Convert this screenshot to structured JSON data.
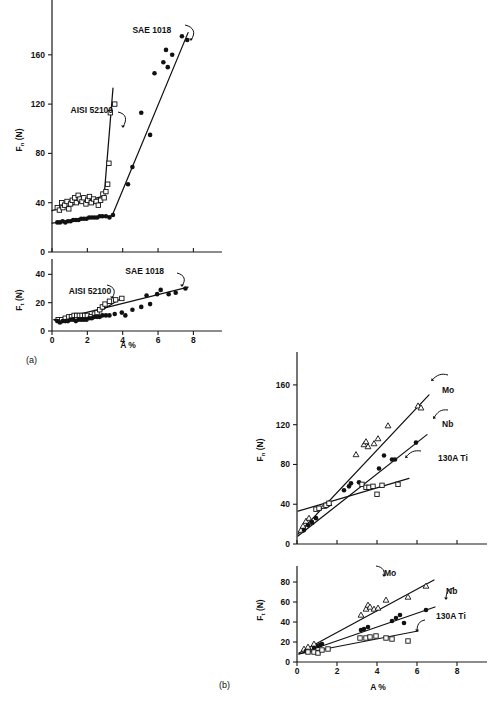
{
  "figure": {
    "panel_a_label": "(a)",
    "panel_b_label": "(b)",
    "xlabel": "A %"
  },
  "chart_data": [
    {
      "id": "a-upper",
      "type": "scatter",
      "title": "",
      "xlabel": "",
      "ylabel": "F_n (N)",
      "ylabel_main": "F",
      "ylabel_sub": "n",
      "ylabel_unit": " (N)",
      "xlim": [
        0,
        8.6
      ],
      "ylim": [
        0,
        185
      ],
      "xticks": [
        0,
        2,
        4,
        6,
        8
      ],
      "xticklabels": [
        "0",
        "2",
        "4",
        "6",
        "8"
      ],
      "yticks": [
        0,
        40,
        80,
        120,
        160
      ],
      "yticklabels": [
        "0",
        "40",
        "80",
        "120",
        "160"
      ],
      "grid": false,
      "legend": "annotations",
      "annotations": [
        {
          "text": "SAE 1018",
          "x": 4.55,
          "y": 178
        },
        {
          "text": "AISI 52100",
          "x": 1.05,
          "y": 113
        }
      ],
      "series": [
        {
          "name": "AISI 52100",
          "marker": "open-square",
          "points": [
            [
              0.3,
              36
            ],
            [
              0.42,
              34
            ],
            [
              0.55,
              40
            ],
            [
              0.62,
              36
            ],
            [
              0.72,
              38
            ],
            [
              0.85,
              41
            ],
            [
              0.95,
              35
            ],
            [
              1.05,
              39
            ],
            [
              1.15,
              42
            ],
            [
              1.28,
              44
            ],
            [
              1.38,
              40
            ],
            [
              1.48,
              46
            ],
            [
              1.58,
              43
            ],
            [
              1.7,
              41
            ],
            [
              1.8,
              44
            ],
            [
              1.92,
              39
            ],
            [
              2.02,
              42
            ],
            [
              2.12,
              45
            ],
            [
              2.22,
              40
            ],
            [
              2.35,
              43
            ],
            [
              2.5,
              41
            ],
            [
              2.62,
              38
            ],
            [
              2.75,
              42
            ],
            [
              2.88,
              47
            ],
            [
              2.95,
              44
            ],
            [
              3.05,
              49
            ],
            [
              3.15,
              55
            ],
            [
              3.22,
              72
            ],
            [
              3.3,
              113
            ],
            [
              3.55,
              120
            ]
          ],
          "trend": [
            [
              0.0,
              33.5
            ],
            [
              2.95,
              45.5
            ],
            [
              3.45,
              133
            ]
          ]
        },
        {
          "name": "SAE 1018",
          "marker": "filled-circle",
          "points": [
            [
              0.3,
              24
            ],
            [
              0.45,
              24
            ],
            [
              0.6,
              25
            ],
            [
              0.75,
              24
            ],
            [
              0.9,
              25
            ],
            [
              1.05,
              25
            ],
            [
              1.2,
              26
            ],
            [
              1.35,
              26
            ],
            [
              1.5,
              26
            ],
            [
              1.65,
              27
            ],
            [
              1.8,
              27
            ],
            [
              1.95,
              27
            ],
            [
              2.1,
              28
            ],
            [
              2.25,
              28
            ],
            [
              2.4,
              28
            ],
            [
              2.55,
              28
            ],
            [
              2.7,
              29
            ],
            [
              2.85,
              29
            ],
            [
              3.05,
              29
            ],
            [
              3.25,
              28
            ],
            [
              3.45,
              30
            ],
            [
              4.3,
              55
            ],
            [
              4.55,
              69
            ],
            [
              5.05,
              113
            ],
            [
              5.55,
              95
            ],
            [
              5.8,
              145
            ],
            [
              6.3,
              154
            ],
            [
              6.45,
              164
            ],
            [
              6.55,
              150
            ],
            [
              6.8,
              160
            ],
            [
              7.35,
              175
            ],
            [
              7.65,
              172
            ]
          ],
          "trend": [
            [
              0.0,
              23.5
            ],
            [
              3.4,
              29.5
            ],
            [
              7.7,
              178
            ]
          ]
        }
      ]
    },
    {
      "id": "a-lower",
      "type": "scatter",
      "title": "",
      "xlabel": "A %",
      "ylabel": "F_t (N)",
      "ylabel_main": "F",
      "ylabel_sub": "t",
      "ylabel_unit": " (N)",
      "xlim": [
        0,
        8.6
      ],
      "ylim": [
        0,
        48
      ],
      "xticks": [
        0,
        2,
        4,
        6,
        8
      ],
      "xticklabels": [
        "0",
        "2",
        "4",
        "6",
        "8"
      ],
      "yticks": [
        0,
        20,
        40
      ],
      "yticklabels": [
        "0",
        "20",
        "40"
      ],
      "grid": false,
      "legend": "annotations",
      "annotations": [
        {
          "text": "SAE 1018",
          "x": 4.15,
          "y": 40
        },
        {
          "text": "AISI 52100",
          "x": 0.95,
          "y": 26
        }
      ],
      "series": [
        {
          "name": "AISI 52100",
          "marker": "open-square",
          "points": [
            [
              0.35,
              8
            ],
            [
              0.55,
              8
            ],
            [
              0.75,
              9
            ],
            [
              0.95,
              10
            ],
            [
              1.1,
              10
            ],
            [
              1.25,
              11
            ],
            [
              1.4,
              11
            ],
            [
              1.55,
              11
            ],
            [
              1.7,
              11
            ],
            [
              1.85,
              11
            ],
            [
              2.0,
              11
            ],
            [
              2.2,
              10
            ],
            [
              2.4,
              12
            ],
            [
              2.55,
              13
            ],
            [
              2.7,
              15
            ],
            [
              2.85,
              17
            ],
            [
              3.0,
              19
            ],
            [
              3.25,
              21
            ],
            [
              3.6,
              22
            ],
            [
              3.95,
              23
            ]
          ],
          "trend": [
            [
              0.1,
              8
            ],
            [
              2.4,
              11.5
            ],
            [
              4.05,
              24
            ]
          ]
        },
        {
          "name": "SAE 1018",
          "marker": "filled-circle",
          "points": [
            [
              0.3,
              7
            ],
            [
              0.45,
              6
            ],
            [
              0.6,
              7
            ],
            [
              0.75,
              7
            ],
            [
              0.9,
              7
            ],
            [
              1.05,
              8
            ],
            [
              1.2,
              8
            ],
            [
              1.35,
              7
            ],
            [
              1.5,
              8
            ],
            [
              1.65,
              8
            ],
            [
              1.8,
              8
            ],
            [
              1.95,
              8
            ],
            [
              2.1,
              9
            ],
            [
              2.25,
              9
            ],
            [
              2.4,
              10
            ],
            [
              2.55,
              10
            ],
            [
              2.7,
              10
            ],
            [
              2.85,
              11
            ],
            [
              3.05,
              11
            ],
            [
              3.25,
              11
            ],
            [
              3.55,
              12
            ],
            [
              3.95,
              13
            ],
            [
              4.15,
              11
            ],
            [
              4.55,
              15
            ],
            [
              5.05,
              17
            ],
            [
              5.35,
              25
            ],
            [
              5.55,
              19
            ],
            [
              5.95,
              26
            ],
            [
              6.15,
              29
            ],
            [
              6.6,
              26
            ],
            [
              7.0,
              27
            ],
            [
              7.55,
              30
            ]
          ],
          "trend": [
            [
              0.15,
              7.5
            ],
            [
              7.7,
              31
            ]
          ]
        }
      ]
    },
    {
      "id": "b-upper",
      "type": "scatter",
      "title": "",
      "xlabel": "",
      "ylabel": "F_n (N)",
      "ylabel_main": "F",
      "ylabel_sub": "n",
      "ylabel_unit": " (N)",
      "xlim": [
        0,
        8.6
      ],
      "ylim": [
        0,
        175
      ],
      "xticks": [
        0,
        2,
        4,
        6,
        8
      ],
      "xticklabels": [
        "0",
        "2",
        "4",
        "6",
        "8"
      ],
      "yticks": [
        0,
        40,
        80,
        120,
        160
      ],
      "yticklabels": [
        "0",
        "40",
        "80",
        "120",
        "160"
      ],
      "grid": false,
      "legend": "annotations",
      "annotations": [
        {
          "text": "Mo",
          "x": 7.25,
          "y": 152
        },
        {
          "text": "Nb",
          "x": 7.25,
          "y": 118
        },
        {
          "text": "130A Ti",
          "x": 7.05,
          "y": 83
        }
      ],
      "series": [
        {
          "name": "Mo",
          "marker": "open-triangle",
          "points": [
            [
              0.2,
              14
            ],
            [
              0.3,
              18
            ],
            [
              0.45,
              23
            ],
            [
              0.6,
              26
            ],
            [
              0.7,
              22
            ],
            [
              1.35,
              38
            ],
            [
              1.5,
              40
            ],
            [
              1.6,
              41
            ],
            [
              2.95,
              90
            ],
            [
              3.35,
              100
            ],
            [
              3.45,
              103
            ],
            [
              3.55,
              98
            ],
            [
              3.85,
              101
            ],
            [
              4.05,
              106
            ],
            [
              4.55,
              119
            ],
            [
              6.05,
              139
            ],
            [
              6.2,
              137
            ]
          ],
          "trend": [
            [
              0.05,
              10
            ],
            [
              6.6,
              150
            ]
          ]
        },
        {
          "name": "Nb",
          "marker": "filled-circle",
          "points": [
            [
              0.35,
              14
            ],
            [
              0.55,
              19
            ],
            [
              0.75,
              22
            ],
            [
              0.95,
              26
            ],
            [
              2.35,
              54
            ],
            [
              2.6,
              58
            ],
            [
              2.7,
              61
            ],
            [
              3.1,
              62
            ],
            [
              4.1,
              76
            ],
            [
              4.35,
              89
            ],
            [
              4.75,
              85
            ],
            [
              4.9,
              85
            ],
            [
              5.95,
              102
            ]
          ],
          "trend": [
            [
              0.05,
              8
            ],
            [
              6.5,
              110
            ]
          ]
        },
        {
          "name": "130A Ti",
          "marker": "open-square",
          "points": [
            [
              0.95,
              35
            ],
            [
              1.1,
              36
            ],
            [
              1.45,
              39
            ],
            [
              1.6,
              41
            ],
            [
              3.25,
              60
            ],
            [
              3.45,
              57
            ],
            [
              3.6,
              57
            ],
            [
              3.8,
              58
            ],
            [
              4.0,
              50
            ],
            [
              4.25,
              59
            ],
            [
              5.05,
              60
            ]
          ],
          "trend": [
            [
              0.05,
              33
            ],
            [
              5.6,
              66
            ]
          ]
        }
      ]
    },
    {
      "id": "b-lower",
      "type": "scatter",
      "title": "",
      "xlabel": "A %",
      "ylabel": "F_t (N)",
      "ylabel_main": "F",
      "ylabel_sub": "t",
      "ylabel_unit": " (N)",
      "xlim": [
        0,
        8.6
      ],
      "ylim": [
        0,
        92
      ],
      "xticks": [
        0,
        2,
        4,
        6,
        8
      ],
      "xticklabels": [
        "0",
        "2",
        "4",
        "6",
        "8"
      ],
      "yticks": [
        0,
        20,
        40,
        60,
        80
      ],
      "yticklabels": [
        "0",
        "20",
        "40",
        "60",
        "80"
      ],
      "grid": false,
      "legend": "annotations",
      "annotations": [
        {
          "text": "Mo",
          "x": 4.35,
          "y": 86
        },
        {
          "text": "Nb",
          "x": 7.45,
          "y": 68
        },
        {
          "text": "130A Ti",
          "x": 6.95,
          "y": 43
        }
      ],
      "series": [
        {
          "name": "Mo",
          "marker": "open-triangle",
          "points": [
            [
              0.35,
              13
            ],
            [
              0.55,
              15
            ],
            [
              0.85,
              18
            ],
            [
              3.2,
              47
            ],
            [
              3.45,
              53
            ],
            [
              3.55,
              57
            ],
            [
              3.65,
              55
            ],
            [
              3.85,
              53
            ],
            [
              4.05,
              54
            ],
            [
              4.45,
              62
            ],
            [
              5.55,
              65
            ],
            [
              6.45,
              76
            ]
          ],
          "trend": [
            [
              0.1,
              9
            ],
            [
              6.85,
              82
            ]
          ]
        },
        {
          "name": "Nb",
          "marker": "filled-circle",
          "points": [
            [
              0.45,
              11
            ],
            [
              0.85,
              14
            ],
            [
              1.05,
              16
            ],
            [
              1.15,
              17
            ],
            [
              1.25,
              18
            ],
            [
              3.2,
              32
            ],
            [
              3.35,
              33
            ],
            [
              3.55,
              35
            ],
            [
              4.75,
              41
            ],
            [
              4.95,
              44
            ],
            [
              5.15,
              47
            ],
            [
              5.35,
              39
            ],
            [
              6.45,
              52
            ]
          ],
          "trend": [
            [
              0.1,
              8
            ],
            [
              6.9,
              55
            ]
          ]
        },
        {
          "name": "130A Ti",
          "marker": "open-square",
          "points": [
            [
              0.55,
              10
            ],
            [
              0.85,
              10
            ],
            [
              1.05,
              9
            ],
            [
              1.25,
              12
            ],
            [
              1.55,
              13
            ],
            [
              3.15,
              24
            ],
            [
              3.45,
              24
            ],
            [
              3.65,
              25
            ],
            [
              3.95,
              26
            ],
            [
              4.45,
              24
            ],
            [
              4.75,
              23
            ],
            [
              5.55,
              21
            ]
          ],
          "trend": [
            [
              0.1,
              8
            ],
            [
              6.05,
              31
            ]
          ]
        }
      ]
    }
  ]
}
